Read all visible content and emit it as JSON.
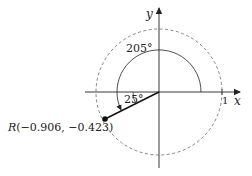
{
  "diagram": {
    "type": "unit-circle-angle",
    "axes": {
      "x_label": "x",
      "y_label": "y",
      "unit_tick_label": "1"
    },
    "angles": {
      "rotation_label": "205°",
      "reference_label": "25°"
    },
    "point": {
      "name": "R",
      "coords_label": "(−0.906, −0.423)",
      "x": -0.906,
      "y": -0.423
    },
    "colors": {
      "stroke": "#222222",
      "dashed_circle": "#666666",
      "background": "#ffffff"
    }
  }
}
